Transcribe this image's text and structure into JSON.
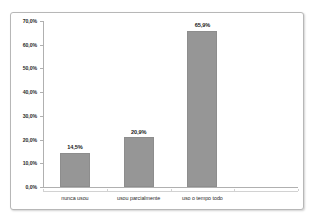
{
  "chart_data": {
    "type": "bar",
    "title": "",
    "subtitle": "",
    "xlabel": "",
    "ylabel": "",
    "categories": [
      "nunca usou",
      "usou parcialmente",
      "uso o tempo todo"
    ],
    "values": [
      14.5,
      20.9,
      65.9
    ],
    "value_labels": [
      "14,5%",
      "20,9%",
      "65,9%"
    ],
    "series": [
      {
        "name": "",
        "values": [
          14.5,
          20.9,
          65.9
        ]
      }
    ],
    "ylim": [
      0,
      70
    ],
    "ytick_step": 10,
    "ytick_labels": [
      "0,0%",
      "10,0%",
      "20,0%",
      "30,0%",
      "40,0%",
      "50,0%",
      "60,0%",
      "70,0%"
    ],
    "ytick_values": [
      0,
      10,
      20,
      30,
      40,
      50,
      60,
      70
    ],
    "grid": false,
    "legend": false,
    "legend_position": "none",
    "decimal_separator": ",",
    "category_slots": 4,
    "colors": {
      "bar_fill": "#969696",
      "bar_border": "#8d8d8d",
      "axis_line": "#b0b0b0",
      "category_axis_line": "#d2d2d2",
      "frame_border": "#b7b7b7",
      "plot_background": "#ffffff",
      "label_text": "#1a1a1a",
      "tick_text": "#2b2b2b"
    }
  }
}
